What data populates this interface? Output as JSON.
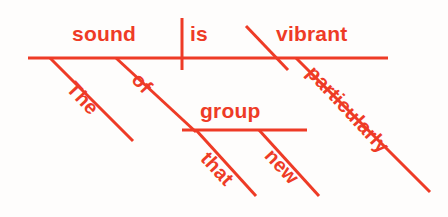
{
  "diagram": {
    "kind": "reed-kellogg-sentence-diagram",
    "sentence": "The sound of that new group is particularly vibrant.",
    "ink_color": "#ee3b26",
    "background_color": "#fefdfc",
    "canvas": {
      "width": 448,
      "height": 217
    },
    "words": {
      "subject": "sound",
      "verb": "is",
      "subject_complement": "vibrant",
      "subject_article": "The",
      "preposition": "of",
      "prep_object": "group",
      "prep_object_determiner": "that",
      "prep_object_adjective": "new",
      "complement_adverb": "particularly"
    },
    "labels": [
      {
        "id": "subject",
        "text": "sound",
        "x": 72,
        "y": 23,
        "rotate": 0,
        "size": 21
      },
      {
        "id": "verb",
        "text": "is",
        "x": 190,
        "y": 23,
        "rotate": 0,
        "size": 21
      },
      {
        "id": "complement",
        "text": "vibrant",
        "x": 276,
        "y": 23,
        "rotate": 0,
        "size": 21
      },
      {
        "id": "prep-object",
        "text": "group",
        "x": 200,
        "y": 100,
        "rotate": 0,
        "size": 21
      },
      {
        "id": "article",
        "text": "The",
        "x": 78,
        "y": 78,
        "rotate": 47,
        "size": 20
      },
      {
        "id": "preposition",
        "text": "of",
        "x": 143,
        "y": 69,
        "rotate": 47,
        "size": 20
      },
      {
        "id": "determiner",
        "text": "that",
        "x": 212,
        "y": 148,
        "rotate": 47,
        "size": 20
      },
      {
        "id": "adjective",
        "text": "new",
        "x": 276,
        "y": 145,
        "rotate": 47,
        "size": 20
      },
      {
        "id": "adverb",
        "text": "particularly",
        "x": 318,
        "y": 62,
        "rotate": 47,
        "size": 20
      }
    ],
    "lines": [
      {
        "id": "main-baseline",
        "x1": 28,
        "y1": 58,
        "x2": 388,
        "y2": 58,
        "width": 3.0
      },
      {
        "id": "subject-verb-divider",
        "x1": 182,
        "y1": 18,
        "x2": 182,
        "y2": 70,
        "width": 3.0
      },
      {
        "id": "complement-divider",
        "x1": 246,
        "y1": 26,
        "x2": 288,
        "y2": 70,
        "width": 3.0
      },
      {
        "id": "article-slant",
        "x1": 50,
        "y1": 58,
        "x2": 133,
        "y2": 141,
        "width": 3.0
      },
      {
        "id": "preposition-slant",
        "x1": 116,
        "y1": 58,
        "x2": 196,
        "y2": 132,
        "width": 3.0
      },
      {
        "id": "prep-object-baseline",
        "x1": 182,
        "y1": 130,
        "x2": 307,
        "y2": 130,
        "width": 3.0
      },
      {
        "id": "determiner-slant",
        "x1": 196,
        "y1": 130,
        "x2": 256,
        "y2": 196,
        "width": 3.0
      },
      {
        "id": "adjective-slant",
        "x1": 259,
        "y1": 130,
        "x2": 319,
        "y2": 196,
        "width": 3.0
      },
      {
        "id": "adverb-slant",
        "x1": 296,
        "y1": 58,
        "x2": 430,
        "y2": 192,
        "width": 3.0
      }
    ]
  }
}
